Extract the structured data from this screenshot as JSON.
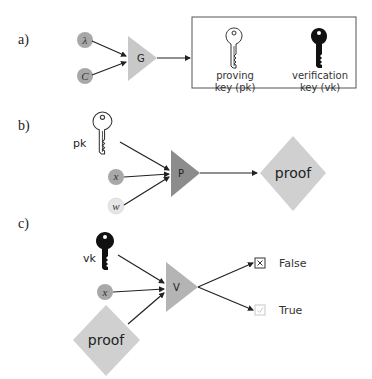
{
  "diagram": {
    "panels": {
      "a": {
        "label": "a)",
        "inputs": [
          {
            "symbol": "λ",
            "name": "lambda"
          },
          {
            "symbol": "C",
            "name": "circuit"
          }
        ],
        "generator": {
          "label": "G"
        },
        "output_box": {
          "keys": [
            {
              "line1": "proving",
              "line2": "key (pk)",
              "style": "outline"
            },
            {
              "line1": "verification",
              "line2": "key (vk)",
              "style": "filled"
            }
          ]
        }
      },
      "b": {
        "label": "b)",
        "key_label": "pk",
        "inputs": [
          {
            "symbol": "x",
            "name": "public-input"
          },
          {
            "symbol": "w",
            "name": "witness"
          }
        ],
        "prover": {
          "label": "P"
        },
        "output": {
          "label": "proof"
        }
      },
      "c": {
        "label": "c)",
        "key_label": "vk",
        "inputs": [
          {
            "symbol": "x",
            "name": "public-input"
          }
        ],
        "proof_input": {
          "label": "proof"
        },
        "verifier": {
          "label": "V"
        },
        "outputs": [
          {
            "label": "False",
            "icon": "x-box-icon"
          },
          {
            "label": "True",
            "icon": "check-box-icon"
          }
        ]
      }
    },
    "colors": {
      "triangle_light": "#c8c8c8",
      "triangle_dark": "#8c8c8c",
      "circle_dark": "#a8a8a8",
      "circle_light": "#e6e6e6",
      "diamond": "#d0d0d0",
      "edge": "#222222"
    }
  }
}
